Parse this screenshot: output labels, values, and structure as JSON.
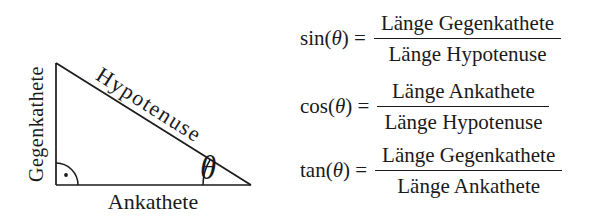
{
  "figure": {
    "background": "#ffffff",
    "ink_color": "#1a1a1a"
  },
  "triangle": {
    "label_opposite": "Gegenkathete",
    "label_hypotenuse": "Hypotenuse",
    "label_adjacent": "Ankathete",
    "angle_symbol": "θ",
    "right_angle_marker": "arc-with-dot"
  },
  "formulas": [
    {
      "name": "sin",
      "open_paren": "(",
      "theta": "θ",
      "close_equals": ") =",
      "numerator": "Länge Gegenkathete",
      "denominator": "Länge Hypotenuse"
    },
    {
      "name": "cos",
      "open_paren": "(",
      "theta": "θ",
      "close_equals": ") =",
      "numerator": "Länge Ankathete",
      "denominator": "Länge Hypotenuse"
    },
    {
      "name": "tan",
      "open_paren": "(",
      "theta": "θ",
      "close_equals": ") =",
      "numerator": "Länge Gegenkathete",
      "denominator": "Länge Ankathete"
    }
  ]
}
